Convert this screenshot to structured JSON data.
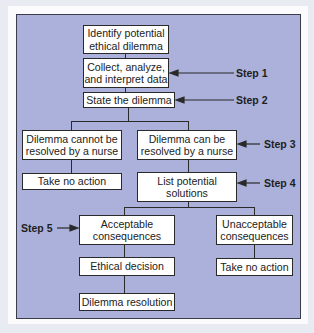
{
  "diagram": {
    "title": "",
    "colors": {
      "background": "#e9ebf3",
      "frame_fill": "#abb1da",
      "frame_border": "#3a3c4a",
      "box_fill": "#ffffff",
      "line": "#2a2a2a"
    },
    "nodes": [
      {
        "id": "identify",
        "label": "Identify potential\nethical dilemma"
      },
      {
        "id": "collect",
        "label": "Collect, analyze,\nand interpret data"
      },
      {
        "id": "state",
        "label": "State the dilemma"
      },
      {
        "id": "cannot",
        "label": "Dilemma cannot be\nresolved by a nurse"
      },
      {
        "id": "can",
        "label": "Dilemma can be\nresolved by a nurse"
      },
      {
        "id": "no_action_left",
        "label": "Take no action"
      },
      {
        "id": "list",
        "label": "List potential\nsolutions"
      },
      {
        "id": "acceptable",
        "label": "Acceptable\nconsequences"
      },
      {
        "id": "unacceptable",
        "label": "Unacceptable\nconsequences"
      },
      {
        "id": "decision",
        "label": "Ethical decision"
      },
      {
        "id": "no_action_right",
        "label": "Take no action"
      },
      {
        "id": "resolution",
        "label": "Dilemma resolution"
      }
    ],
    "edges": [
      [
        "identify",
        "collect"
      ],
      [
        "collect",
        "state"
      ],
      [
        "state",
        "cannot"
      ],
      [
        "state",
        "can"
      ],
      [
        "cannot",
        "no_action_left"
      ],
      [
        "can",
        "list"
      ],
      [
        "list",
        "acceptable"
      ],
      [
        "list",
        "unacceptable"
      ],
      [
        "acceptable",
        "decision"
      ],
      [
        "decision",
        "resolution"
      ],
      [
        "unacceptable",
        "no_action_right"
      ]
    ],
    "steps": [
      {
        "label": "Step 1",
        "target": "collect"
      },
      {
        "label": "Step 2",
        "target": "state"
      },
      {
        "label": "Step 3",
        "target": "can"
      },
      {
        "label": "Step 4",
        "target": "list"
      },
      {
        "label": "Step 5",
        "target": "acceptable"
      }
    ]
  }
}
